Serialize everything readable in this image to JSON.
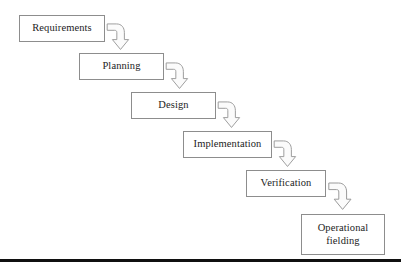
{
  "diagram": {
    "type": "waterfall-process-flow",
    "box_border_color": "#8d8d8d",
    "box_fill_color": "#ffffff",
    "arrow_outline_color": "#9a9a9a",
    "arrow_fill_color": "#fbfbfb",
    "text_color": "#1c1c1c",
    "rule_color": "#101010",
    "stages": [
      {
        "id": "requirements",
        "label": "Requirements",
        "x": 19,
        "y": 15,
        "w": 86,
        "h": 27
      },
      {
        "id": "planning",
        "label": "Planning",
        "x": 79,
        "y": 53,
        "w": 85,
        "h": 27
      },
      {
        "id": "design",
        "label": "Design",
        "x": 131,
        "y": 92,
        "w": 85,
        "h": 27
      },
      {
        "id": "implementation",
        "label": "Implementation",
        "x": 183,
        "y": 131,
        "w": 89,
        "h": 27
      },
      {
        "id": "verification",
        "label": "Verification",
        "x": 246,
        "y": 170,
        "w": 80,
        "h": 27
      },
      {
        "id": "operational-fielding",
        "label": "Operational\nfielding",
        "x": 301,
        "y": 214,
        "w": 84,
        "h": 41
      }
    ],
    "connectors": [
      {
        "id": "requirements-to-planning",
        "from": "requirements",
        "to": "planning",
        "shape": "curved-down-arrow",
        "x": 106,
        "y": 22,
        "w": 24,
        "h": 29
      },
      {
        "id": "planning-to-design",
        "from": "planning",
        "to": "design",
        "shape": "curved-down-arrow",
        "x": 165,
        "y": 61,
        "w": 24,
        "h": 29
      },
      {
        "id": "design-to-implementation",
        "from": "design",
        "to": "implementation",
        "shape": "curved-down-arrow",
        "x": 217,
        "y": 100,
        "w": 24,
        "h": 29
      },
      {
        "id": "implementation-to-verification",
        "from": "implementation",
        "to": "verification",
        "shape": "curved-down-arrow",
        "x": 273,
        "y": 139,
        "w": 24,
        "h": 29
      },
      {
        "id": "verification-to-operational-fielding",
        "from": "verification",
        "to": "operational-fielding",
        "shape": "curved-down-arrow",
        "x": 328,
        "y": 180,
        "w": 24,
        "h": 32
      }
    ],
    "bottom_rule": {
      "y": 259,
      "height": 3,
      "width": 401
    }
  }
}
